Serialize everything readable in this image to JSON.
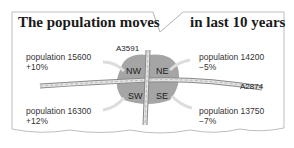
{
  "title": {
    "left": "The population moves",
    "right": "in last 10 years"
  },
  "roads": {
    "north_south": "A3591",
    "east_west": "A2874"
  },
  "quadrants": {
    "nw": "NW",
    "ne": "NE",
    "sw": "SW",
    "se": "SE"
  },
  "areas": [
    {
      "id": "nw",
      "population_label": "population 15600",
      "change": "+10%"
    },
    {
      "id": "ne",
      "population_label": "population 14200",
      "change": "−5%"
    },
    {
      "id": "sw",
      "population_label": "population 16300",
      "change": "+12%"
    },
    {
      "id": "se",
      "population_label": "population 13750",
      "change": "−7%"
    }
  ],
  "colors": {
    "region": "#9a9a9a",
    "road": "#d8d8d8",
    "arrow": "#e0e0e0",
    "text": "#333333"
  }
}
